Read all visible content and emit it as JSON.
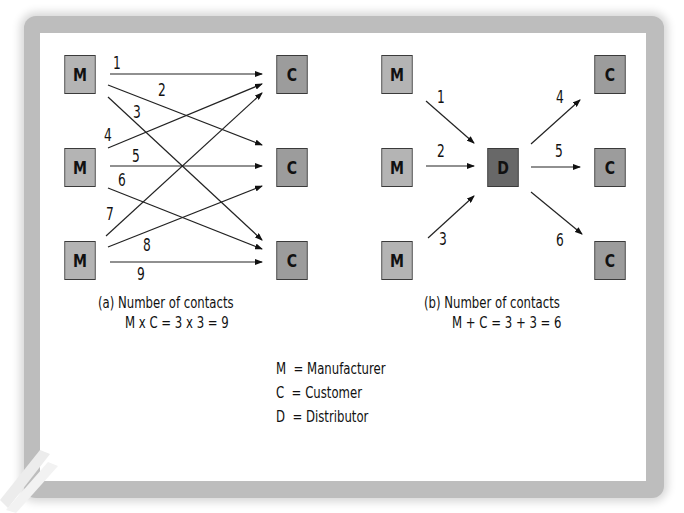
{
  "diagram_a": {
    "manufacturers": [
      "M",
      "M",
      "M"
    ],
    "customers": [
      "C",
      "C",
      "C"
    ],
    "contact_numbers": [
      "1",
      "2",
      "3",
      "4",
      "5",
      "6",
      "7",
      "8",
      "9"
    ],
    "caption_line1": "(a) Number of contacts",
    "caption_line2": "M x C = 3 x 3 = 9"
  },
  "diagram_b": {
    "manufacturers": [
      "M",
      "M",
      "M"
    ],
    "distributor": "D",
    "customers": [
      "C",
      "C",
      "C"
    ],
    "contact_numbers": [
      "1",
      "2",
      "3",
      "4",
      "5",
      "6"
    ],
    "caption_line1": "(b) Number of contacts",
    "caption_line2": "M + C = 3 + 3 = 6"
  },
  "legend": {
    "items": [
      {
        "key": "M",
        "label": "= Manufacturer"
      },
      {
        "key": "C",
        "label": "= Customer"
      },
      {
        "key": "D",
        "label": "= Distributor"
      }
    ]
  },
  "colors": {
    "manufacturer_box": "#b4b4b4",
    "customer_box": "#9c9c9c",
    "distributor_box": "#686868"
  }
}
